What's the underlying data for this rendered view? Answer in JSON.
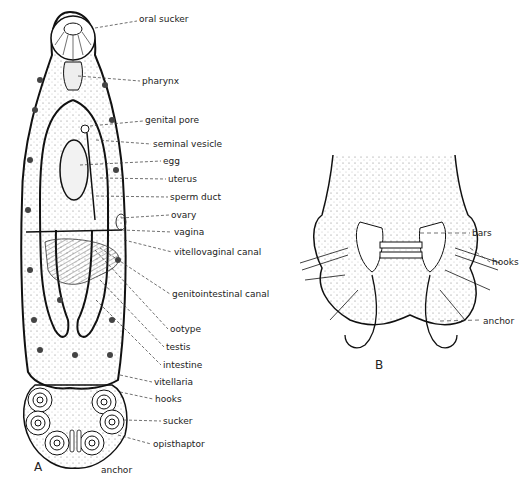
{
  "figure": {
    "panel_a": {
      "letter": "A",
      "labels": [
        {
          "text": "oral sucker",
          "x": 139,
          "y": 17
        },
        {
          "text": "pharynx",
          "x": 142,
          "y": 77
        },
        {
          "text": "genital pore",
          "x": 145,
          "y": 117
        },
        {
          "text": "seminal vesicle",
          "x": 153,
          "y": 140
        },
        {
          "text": "egg",
          "x": 163,
          "y": 157
        },
        {
          "text": "uterus",
          "x": 168,
          "y": 175
        },
        {
          "text": "sperm duct",
          "x": 170,
          "y": 193
        },
        {
          "text": "ovary",
          "x": 171,
          "y": 211
        },
        {
          "text": "vagina",
          "x": 174,
          "y": 228
        },
        {
          "text": "vitellovaginal canal",
          "x": 174,
          "y": 248
        },
        {
          "text": "genitointestinal canal",
          "x": 172,
          "y": 290
        },
        {
          "text": "ootype",
          "x": 170,
          "y": 325
        },
        {
          "text": "testis",
          "x": 166,
          "y": 343
        },
        {
          "text": "intestine",
          "x": 163,
          "y": 361
        },
        {
          "text": "vitellaria",
          "x": 154,
          "y": 378
        },
        {
          "text": "hooks",
          "x": 155,
          "y": 395
        },
        {
          "text": "sucker",
          "x": 163,
          "y": 417
        },
        {
          "text": "opisthaptor",
          "x": 153,
          "y": 440
        },
        {
          "text": "anchor",
          "x": 101,
          "y": 466
        }
      ]
    },
    "panel_b": {
      "letter": "B",
      "labels": [
        {
          "text": "bars",
          "x": 472,
          "y": 229
        },
        {
          "text": "hooks",
          "x": 492,
          "y": 258
        },
        {
          "text": "anchor",
          "x": 483,
          "y": 317
        }
      ]
    }
  }
}
